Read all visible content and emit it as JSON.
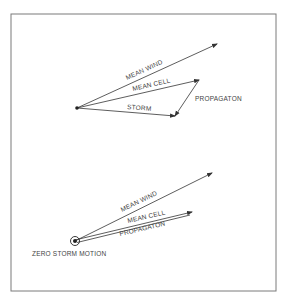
{
  "figure": {
    "frame": {
      "x": 11,
      "y": 14,
      "width": 265,
      "height": 277,
      "stroke": "#7a7a7a"
    },
    "line_color": "#333333",
    "top_diagram": {
      "origin": {
        "x": 77,
        "y": 108
      },
      "vectors": [
        {
          "id": "mean-wind",
          "label": "MEAN WIND",
          "from": [
            77,
            108
          ],
          "to": [
            217,
            44
          ]
        },
        {
          "id": "mean-cell",
          "label": "MEAN CELL",
          "from": [
            77,
            108
          ],
          "to": [
            199,
            80
          ]
        },
        {
          "id": "storm",
          "label": "STORM",
          "from": [
            77,
            108
          ],
          "to": [
            175,
            116
          ]
        },
        {
          "id": "propagation",
          "label": "PROPAGATON",
          "from": [
            199,
            80
          ],
          "to": [
            175,
            116
          ]
        }
      ]
    },
    "bottom_diagram": {
      "origin": {
        "x": 75,
        "y": 241
      },
      "origin_label": "ZERO STORM MOTION",
      "vectors": [
        {
          "id": "mean-wind",
          "label": "MEAN WIND",
          "from": [
            75,
            241
          ],
          "to": [
            212,
            173
          ]
        },
        {
          "id": "mean-cell",
          "label": "MEAN CELL",
          "from": [
            75,
            241
          ],
          "to": [
            192,
            213
          ]
        },
        {
          "id": "propagation",
          "label": "PROPAGATON",
          "from": [
            192,
            213
          ],
          "to": [
            75,
            241
          ]
        }
      ]
    }
  }
}
